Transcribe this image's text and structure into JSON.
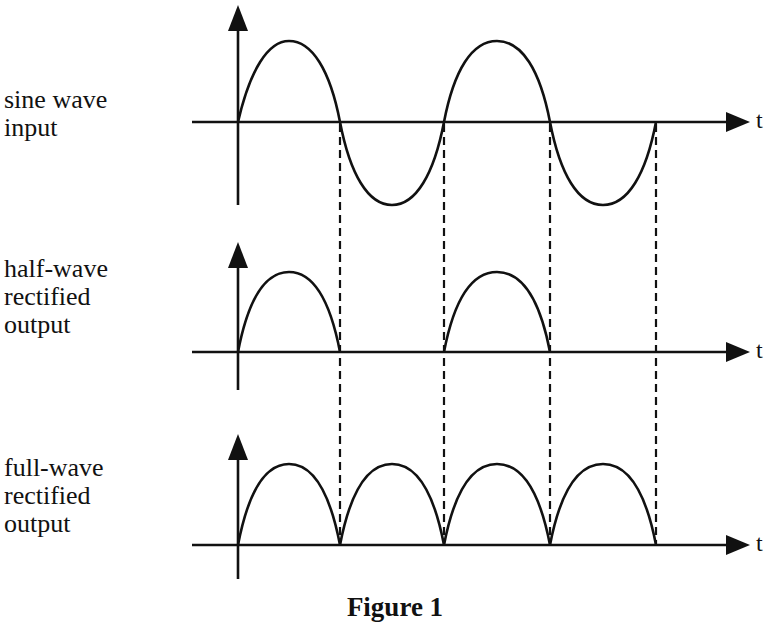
{
  "figure": {
    "title_partial": "Rectifier Waveforms (title cut off)",
    "caption": "Figure 1",
    "axis_label": "t"
  },
  "panels": [
    {
      "id": "sine",
      "label_lines": [
        "sine wave",
        "input"
      ],
      "waveform": "sine"
    },
    {
      "id": "half",
      "label_lines": [
        "half-wave",
        "rectified",
        "output"
      ],
      "waveform": "half-wave-rectified"
    },
    {
      "id": "full",
      "label_lines": [
        "full-wave",
        "rectified",
        "output"
      ],
      "waveform": "full-wave-rectified"
    }
  ],
  "layout_values": {
    "zero_crossings_x": [
      238,
      340,
      444,
      550,
      656
    ],
    "half_cycles_shown": 4,
    "stroke_color": "#111111",
    "background": "#ffffff"
  }
}
